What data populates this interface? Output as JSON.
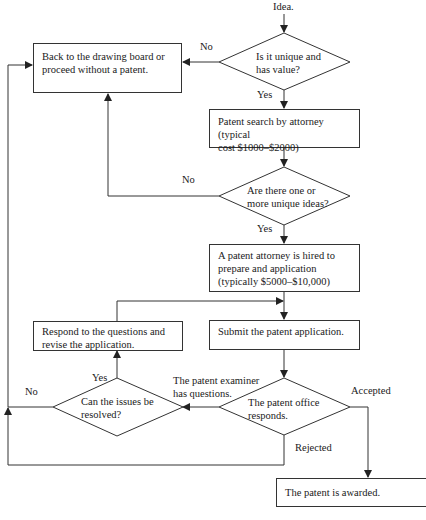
{
  "flowchart": {
    "start": "Idea.",
    "nodes": {
      "q_unique": "Is it unique and has value?",
      "q_unique_l1": "Is it unique and",
      "q_unique_l2": "has value?",
      "back": "Back to the drawing board or proceed without a patent.",
      "back_l1": "Back to the drawing board or",
      "back_l2": "proceed without a patent.",
      "search_l1": "Patent search by attorney (typical",
      "search_l2": "cost $1000–$2000)",
      "q_ideas_l1": "Are there one or",
      "q_ideas_l2": "more unique ideas?",
      "hire_l1": "A patent attorney is hired to",
      "hire_l2": "prepare and application",
      "hire_l3": "(typically $5000–$10,000)",
      "submit": "Submit the patent application.",
      "respond_l1": "Respond to the questions and",
      "respond_l2": "revise the application.",
      "q_office_l1": "The patent office",
      "q_office_l2": "responds.",
      "q_resolve_l1": "Can the issues be",
      "q_resolve_l2": "resolved?",
      "awarded": "The patent is awarded."
    },
    "edge_labels": {
      "unique_no": "No",
      "unique_yes": "Yes",
      "ideas_no": "No",
      "ideas_yes": "Yes",
      "examiner_l1": "The patent examiner",
      "examiner_l2": "has questions.",
      "resolve_yes": "Yes",
      "resolve_no": "No",
      "accepted": "Accepted",
      "rejected": "Rejected"
    }
  }
}
